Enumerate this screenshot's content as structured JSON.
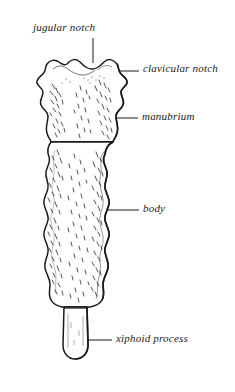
{
  "figure": {
    "view": "anterior",
    "style": "line-drawing-with-stipple",
    "ink_color": "#1a1a1a",
    "fill_color": "#ffffff",
    "background_color": "#ffffff"
  },
  "labels": {
    "jugular_notch": "jugular notch",
    "clavicular_notch": "clavicular notch",
    "manubrium": "manubrium",
    "body": "body",
    "xiphoid_process": "xiphoid process"
  },
  "parts": [
    {
      "id": "manubrium",
      "label": "manubrium"
    },
    {
      "id": "body",
      "label": "body"
    },
    {
      "id": "xiphoid-process",
      "label": "xiphoid process"
    }
  ],
  "features": [
    {
      "id": "jugular-notch",
      "label": "jugular notch"
    },
    {
      "id": "clavicular-notch",
      "label": "clavicular notch"
    }
  ]
}
